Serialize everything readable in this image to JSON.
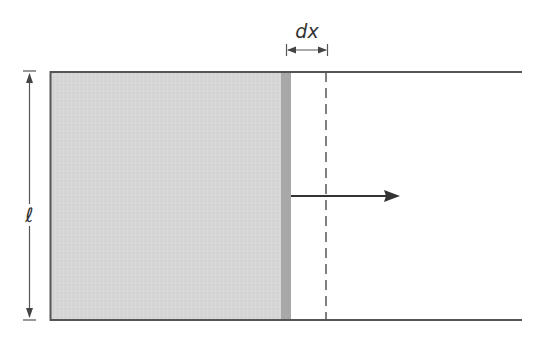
{
  "diagram": {
    "labels": {
      "length": "ℓ",
      "displacement": "dx"
    },
    "colors": {
      "shaded_area": "#d4d4d4",
      "bar": "#a9a9a9",
      "lines": "#555555",
      "arrow": "#333333"
    }
  }
}
